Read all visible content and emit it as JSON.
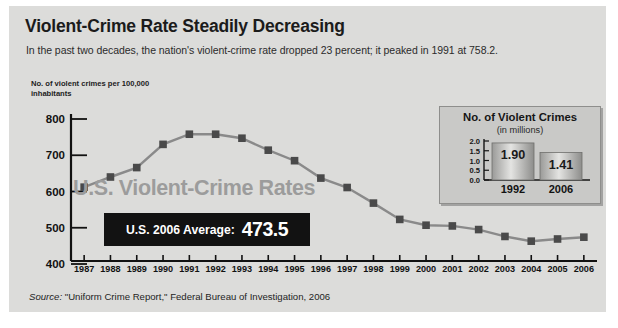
{
  "title": "Violent-Crime Rate Steadily Decreasing",
  "subtitle": "In the past two decades, the nation's violent-crime rate dropped 23 percent; it peaked in 1991 at 758.2.",
  "axis_caption": "No. of violent crimes per 100,000 inhabitants",
  "watermark": "U.S. Violent-Crime Rates",
  "callout": {
    "label": "U.S. 2006 Average:",
    "value": "473.5"
  },
  "source": {
    "prefix": "Source:",
    "text": " \"Uniform Crime Report,\" Federal Bureau of Investigation, 2006"
  },
  "colors": {
    "panel_background": "#dcdcda",
    "line": "#8a8a8a",
    "marker": "#4a4a4a",
    "callout_background": "#121212",
    "callout_text": "#ffffff",
    "watermark": "#9c9c9c",
    "inset_background": "#c9c9c7",
    "inset_border": "#8e8e8c",
    "axis": "#111111"
  },
  "chart_data": [
    {
      "type": "line",
      "title": "U.S. Violent-Crime Rates",
      "xlabel": "",
      "ylabel": "No. of violent crimes per 100,000 inhabitants",
      "ylim": [
        400,
        800
      ],
      "yticks": [
        400,
        500,
        600,
        700,
        800
      ],
      "grid": false,
      "legend": "none",
      "categories": [
        "1987",
        "1988",
        "1989",
        "1990",
        "1991",
        "1992",
        "1993",
        "1994",
        "1995",
        "1996",
        "1997",
        "1998",
        "1999",
        "2000",
        "2001",
        "2002",
        "2003",
        "2004",
        "2005",
        "2006"
      ],
      "values": [
        612,
        640,
        666,
        730,
        758,
        758,
        747,
        714,
        685,
        637,
        611,
        568,
        523,
        507,
        505,
        495,
        476,
        463,
        469,
        474
      ],
      "annotations": [
        "U.S. 2006 Average: 473.5"
      ]
    },
    {
      "type": "bar",
      "title": "No. of Violent Crimes",
      "subtitle": "(in millions)",
      "xlabel": "",
      "ylabel": "",
      "ylim": [
        0.0,
        2.0
      ],
      "yticks": [
        "0.0",
        "0.5",
        "1.0",
        "1.5",
        "2.0"
      ],
      "categories": [
        "1992",
        "2006"
      ],
      "values": [
        1.9,
        1.41
      ],
      "data_labels": [
        "1.90",
        "1.41"
      ]
    }
  ]
}
